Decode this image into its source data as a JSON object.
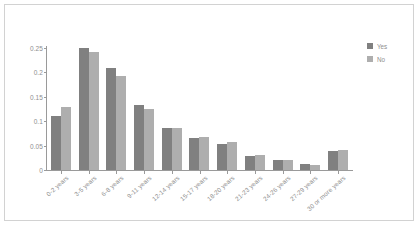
{
  "figure": {
    "background_color": "#ffffff",
    "frame_color": "#d2d2d2",
    "axis_color": "#9a9a9a",
    "tick_label_color": "#8e8e8e"
  },
  "legend": {
    "position": "right",
    "entries": [
      {
        "label": "Yes",
        "color": "#808080"
      },
      {
        "label": "No",
        "color": "#aeaeae"
      }
    ]
  },
  "chart_data": {
    "type": "bar",
    "title": "",
    "subtitle": "",
    "xlabel": "",
    "ylabel": "",
    "grid": false,
    "legend_position": "right",
    "ylim": [
      0,
      0.25
    ],
    "ytick_labels": [
      "0",
      "0.05",
      "0.1",
      "0.15",
      "0.2",
      "0.25"
    ],
    "ytick_values": [
      0,
      0.05,
      0.1,
      0.15,
      0.2,
      0.25
    ],
    "categories": [
      "0-2 years",
      "3-5 years",
      "6-8 years",
      "9-11 years",
      "12-14 years",
      "15-17 years",
      "18-20 years",
      "21-23 years",
      "24-26 years",
      "27-29 years",
      "30 or more years"
    ],
    "series": [
      {
        "name": "Yes",
        "color": "#808080",
        "values": [
          0.111,
          0.25,
          0.209,
          0.133,
          0.087,
          0.065,
          0.053,
          0.028,
          0.021,
          0.012,
          0.038
        ]
      },
      {
        "name": "No",
        "color": "#aeaeae",
        "values": [
          0.13,
          0.242,
          0.192,
          0.126,
          0.087,
          0.068,
          0.057,
          0.031,
          0.021,
          0.01,
          0.041
        ]
      }
    ]
  }
}
